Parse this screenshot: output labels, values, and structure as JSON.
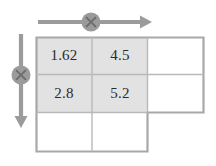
{
  "figure": {
    "kind": "grid-diagram",
    "shading_color": "#e2e2e2",
    "grid_line_color": "#b9b9b9",
    "outline_color": "#a8a8a8",
    "arrow_color": "#9b9b9b",
    "marker_fill": "#9b9b9b",
    "marker_glyph_color": "#6e6e6e",
    "background": "#ffffff"
  },
  "grid": {
    "columns": 3,
    "rows": 3,
    "shaded_block": {
      "rows": 2,
      "cols": 2
    },
    "cells": [
      {
        "row": 0,
        "col": 0,
        "value": "1.62",
        "shaded": true
      },
      {
        "row": 0,
        "col": 1,
        "value": "4.5",
        "shaded": true
      },
      {
        "row": 0,
        "col": 2,
        "value": "",
        "shaded": false
      },
      {
        "row": 1,
        "col": 0,
        "value": "2.8",
        "shaded": true
      },
      {
        "row": 1,
        "col": 1,
        "value": "5.2",
        "shaded": true
      },
      {
        "row": 1,
        "col": 2,
        "value": "",
        "shaded": false
      },
      {
        "row": 2,
        "col": 0,
        "value": "",
        "shaded": false
      },
      {
        "row": 2,
        "col": 1,
        "value": "",
        "shaded": false
      }
    ]
  },
  "arrows": {
    "horizontal": {
      "direction": "right",
      "marker": "circled-cross",
      "marker_glyph": "×"
    },
    "vertical": {
      "direction": "down",
      "marker": "circled-cross",
      "marker_glyph": "×"
    }
  }
}
